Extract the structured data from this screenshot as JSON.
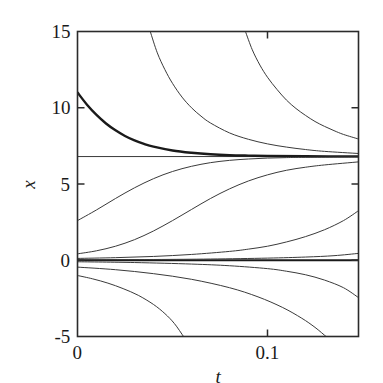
{
  "chart_data": {
    "type": "line",
    "title": "",
    "xlabel": "t",
    "ylabel": "x",
    "xlim": [
      0,
      0.1479
    ],
    "ylim": [
      -5,
      15
    ],
    "xticks": [
      0,
      0.1
    ],
    "xtick_labels": [
      "0",
      "0.1"
    ],
    "yticks": [
      -5,
      0,
      5,
      10,
      15
    ],
    "ytick_labels": [
      "-5",
      "0",
      "5",
      "10",
      "15"
    ],
    "grid": false,
    "legend": null,
    "annotations": [],
    "equilibria": [
      {
        "name": "stable-equilibrium",
        "value": 6.8,
        "style": "thin-horizontal-line"
      },
      {
        "name": "unstable-equilibrium",
        "value": 0.0,
        "style": "thick-horizontal-line"
      }
    ],
    "series": [
      {
        "name": "trajectory-x0-11.0",
        "x0": 0.0,
        "y0": 11.0,
        "asymptote": 6.8,
        "emphasis": "thick",
        "points": [
          [
            0.0,
            11.0
          ],
          [
            0.005,
            10.2
          ],
          [
            0.01,
            9.53
          ],
          [
            0.015,
            8.97
          ],
          [
            0.02,
            8.52
          ],
          [
            0.025,
            8.15
          ],
          [
            0.03,
            7.86
          ],
          [
            0.035,
            7.63
          ],
          [
            0.04,
            7.45
          ],
          [
            0.05,
            7.2
          ],
          [
            0.06,
            7.05
          ],
          [
            0.07,
            6.95
          ],
          [
            0.08,
            6.89
          ],
          [
            0.09,
            6.86
          ],
          [
            0.1,
            6.84
          ],
          [
            0.12,
            6.82
          ],
          [
            0.1479,
            6.81
          ]
        ]
      },
      {
        "name": "trajectory-blowdown-from-top-1",
        "x0": 0.0,
        "y0": 60.0,
        "asymptote": 6.8,
        "emphasis": "thin",
        "entry_t": 0.0383,
        "points": [
          [
            0.0383,
            15.0
          ],
          [
            0.042,
            13.6
          ],
          [
            0.046,
            12.5
          ],
          [
            0.05,
            11.6
          ],
          [
            0.055,
            10.7
          ],
          [
            0.06,
            10.0
          ],
          [
            0.065,
            9.45
          ],
          [
            0.07,
            9.0
          ],
          [
            0.08,
            8.35
          ],
          [
            0.09,
            7.93
          ],
          [
            0.1,
            7.63
          ],
          [
            0.11,
            7.42
          ],
          [
            0.12,
            7.26
          ],
          [
            0.13,
            7.14
          ],
          [
            0.1479,
            7.0
          ]
        ]
      },
      {
        "name": "trajectory-blowdown-from-top-2",
        "x0": 0.0,
        "y0": 200.0,
        "asymptote": 6.8,
        "emphasis": "thin",
        "entry_t": 0.0884,
        "points": [
          [
            0.0884,
            15.0
          ],
          [
            0.092,
            13.8
          ],
          [
            0.096,
            12.8
          ],
          [
            0.1,
            12.0
          ],
          [
            0.105,
            11.2
          ],
          [
            0.11,
            10.5
          ],
          [
            0.115,
            9.95
          ],
          [
            0.12,
            9.5
          ],
          [
            0.125,
            9.1
          ],
          [
            0.13,
            8.78
          ],
          [
            0.135,
            8.5
          ],
          [
            0.14,
            8.25
          ],
          [
            0.1479,
            7.95
          ]
        ]
      },
      {
        "name": "trajectory-x0-2.6",
        "x0": 0.0,
        "y0": 2.6,
        "asymptote": 6.8,
        "emphasis": "thin",
        "points": [
          [
            0.0,
            2.6
          ],
          [
            0.01,
            3.3
          ],
          [
            0.02,
            4.05
          ],
          [
            0.03,
            4.75
          ],
          [
            0.04,
            5.35
          ],
          [
            0.05,
            5.82
          ],
          [
            0.06,
            6.16
          ],
          [
            0.07,
            6.4
          ],
          [
            0.08,
            6.55
          ],
          [
            0.09,
            6.64
          ],
          [
            0.1,
            6.7
          ],
          [
            0.11,
            6.73
          ],
          [
            0.12,
            6.75
          ],
          [
            0.1479,
            6.77
          ]
        ]
      },
      {
        "name": "trajectory-x0-0.4",
        "x0": 0.0,
        "y0": 0.42,
        "asymptote": 6.8,
        "emphasis": "thin",
        "points": [
          [
            0.0,
            0.42
          ],
          [
            0.01,
            0.62
          ],
          [
            0.02,
            0.92
          ],
          [
            0.03,
            1.35
          ],
          [
            0.04,
            1.92
          ],
          [
            0.05,
            2.6
          ],
          [
            0.06,
            3.33
          ],
          [
            0.07,
            4.05
          ],
          [
            0.08,
            4.68
          ],
          [
            0.09,
            5.2
          ],
          [
            0.1,
            5.6
          ],
          [
            0.11,
            5.9
          ],
          [
            0.12,
            6.1
          ],
          [
            0.13,
            6.25
          ],
          [
            0.1479,
            6.45
          ]
        ]
      },
      {
        "name": "trajectory-x0-0.12",
        "x0": 0.0,
        "y0": 0.12,
        "asymptote": 6.8,
        "emphasis": "thin",
        "points": [
          [
            0.0,
            0.12
          ],
          [
            0.02,
            0.17
          ],
          [
            0.04,
            0.25
          ],
          [
            0.06,
            0.38
          ],
          [
            0.08,
            0.58
          ],
          [
            0.09,
            0.73
          ],
          [
            0.1,
            0.92
          ],
          [
            0.11,
            1.2
          ],
          [
            0.12,
            1.55
          ],
          [
            0.13,
            2.0
          ],
          [
            0.14,
            2.6
          ],
          [
            0.1479,
            3.25
          ]
        ]
      },
      {
        "name": "trajectory-x0-0.03",
        "x0": 0.0,
        "y0": 0.03,
        "asymptote": 6.8,
        "emphasis": "thin",
        "points": [
          [
            0.0,
            0.03
          ],
          [
            0.04,
            0.05
          ],
          [
            0.07,
            0.08
          ],
          [
            0.1,
            0.14
          ],
          [
            0.12,
            0.21
          ],
          [
            0.135,
            0.3
          ],
          [
            0.1479,
            0.45
          ]
        ]
      },
      {
        "name": "trajectory-x0-neg-0.1",
        "x0": 0.0,
        "y0": -0.1,
        "asymptote": null,
        "emphasis": "thin",
        "points": [
          [
            0.0,
            -0.1
          ],
          [
            0.03,
            -0.15
          ],
          [
            0.06,
            -0.25
          ],
          [
            0.08,
            -0.36
          ],
          [
            0.1,
            -0.55
          ],
          [
            0.11,
            -0.72
          ],
          [
            0.12,
            -0.95
          ],
          [
            0.13,
            -1.3
          ],
          [
            0.14,
            -1.8
          ],
          [
            0.1479,
            -2.45
          ]
        ]
      },
      {
        "name": "trajectory-x0-neg-0.45",
        "x0": 0.0,
        "y0": -0.45,
        "asymptote": null,
        "emphasis": "thin",
        "exit_t": 0.1308,
        "points": [
          [
            0.0,
            -0.45
          ],
          [
            0.02,
            -0.62
          ],
          [
            0.04,
            -0.88
          ],
          [
            0.06,
            -1.25
          ],
          [
            0.08,
            -1.8
          ],
          [
            0.095,
            -2.4
          ],
          [
            0.108,
            -3.1
          ],
          [
            0.118,
            -3.8
          ],
          [
            0.125,
            -4.4
          ],
          [
            0.1308,
            -5.0
          ]
        ]
      },
      {
        "name": "trajectory-x0-neg-1.0",
        "x0": 0.0,
        "y0": -1.0,
        "asymptote": null,
        "emphasis": "thin",
        "exit_t": 0.0558,
        "points": [
          [
            0.0,
            -1.0
          ],
          [
            0.008,
            -1.22
          ],
          [
            0.016,
            -1.5
          ],
          [
            0.024,
            -1.86
          ],
          [
            0.032,
            -2.3
          ],
          [
            0.04,
            -2.9
          ],
          [
            0.046,
            -3.5
          ],
          [
            0.051,
            -4.15
          ],
          [
            0.0558,
            -5.0
          ]
        ]
      }
    ],
    "colors": {
      "axis": "#2b2b2b",
      "curve": "#3a3a3a",
      "curve_emphasis": "#1a1a1a",
      "background": "#ffffff"
    }
  }
}
